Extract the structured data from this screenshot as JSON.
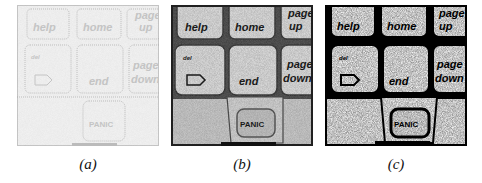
{
  "figure": {
    "panels": [
      {
        "id": "a",
        "caption": "(a)",
        "style": "faint-edge",
        "colors": {
          "bg": "#f2f2f2",
          "ink": "#c8c8c8",
          "frame": "#9a9a9a"
        },
        "keys": {
          "help": "help",
          "home": "home",
          "page_up_1": "page",
          "page_up_2": "up",
          "del": "del",
          "end": "end",
          "page_down_1": "page",
          "page_down_2": "down",
          "panic": "PANIC"
        }
      },
      {
        "id": "b",
        "caption": "(b)",
        "style": "grayscale",
        "colors": {
          "bg": "#d8d8d8",
          "ink": "#1a1a1a",
          "frame": "#202020"
        },
        "keys": {
          "help": "help",
          "home": "home",
          "page_up_1": "page",
          "page_up_2": "up",
          "del": "del",
          "end": "end",
          "page_down_1": "page",
          "page_down_2": "down",
          "panic": "PANIC"
        }
      },
      {
        "id": "c",
        "caption": "(c)",
        "style": "binary",
        "colors": {
          "bg": "#eeeeee",
          "ink": "#000000",
          "frame": "#000000"
        },
        "keys": {
          "help": "help",
          "home": "home",
          "page_up_1": "page",
          "page_up_2": "up",
          "del": "del",
          "end": "end",
          "page_down_1": "page",
          "page_down_2": "down",
          "panic": "PANIC"
        }
      }
    ]
  }
}
